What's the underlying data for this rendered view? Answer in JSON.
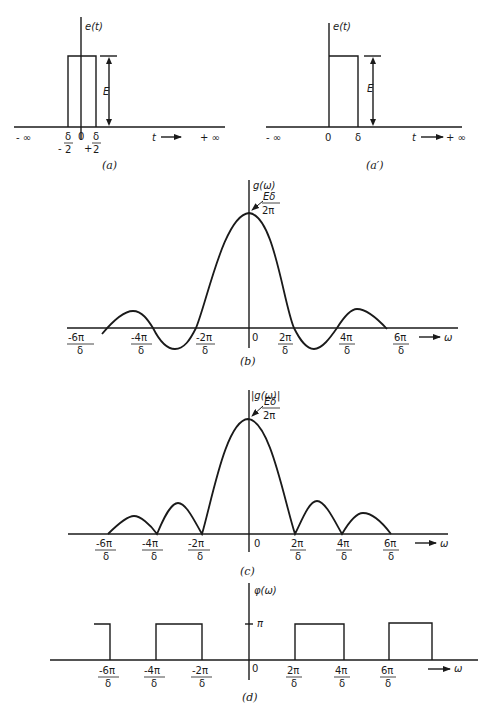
{
  "panel_a": {
    "ylabel": "e(t)",
    "height_label": "E",
    "xlabel": "t",
    "left_inf": "- ∞",
    "right_inf": "+ ∞",
    "origin": "0",
    "left_edge_num": "δ",
    "left_edge_den": "2",
    "left_edge_sign": "-",
    "right_edge_num": "δ",
    "right_edge_den": "2",
    "right_edge_sign": "+",
    "caption": "(a)"
  },
  "panel_a_prime": {
    "ylabel": "e(t)",
    "height_label": "E",
    "xlabel": "t",
    "left_inf": "- ∞",
    "right_inf": "+ ∞",
    "origin": "0",
    "edge": "δ",
    "caption": "(a′)"
  },
  "panel_b": {
    "ylabel": "g(ω)",
    "peak_num": "Eδ",
    "peak_den": "2π",
    "xlabel": "ω",
    "origin": "0",
    "ticks": [
      {
        "num": "-6π",
        "den": "δ"
      },
      {
        "num": "-4π",
        "den": "δ"
      },
      {
        "num": "-2π",
        "den": "δ"
      },
      {
        "num": "2π",
        "den": "δ"
      },
      {
        "num": "4π",
        "den": "δ"
      },
      {
        "num": "6π",
        "den": "δ"
      }
    ],
    "caption": "(b)"
  },
  "panel_c": {
    "ylabel": "|g(ω)|",
    "peak_num": "Eδ",
    "peak_den": "2π",
    "xlabel": "ω",
    "origin": "0",
    "ticks": [
      {
        "num": "-6π",
        "den": "δ"
      },
      {
        "num": "-4π",
        "den": "δ"
      },
      {
        "num": "-2π",
        "den": "δ"
      },
      {
        "num": "2π",
        "den": "δ"
      },
      {
        "num": "4π",
        "den": "δ"
      },
      {
        "num": "6π",
        "den": "δ"
      }
    ],
    "caption": "(c)"
  },
  "panel_d": {
    "ylabel": "φ(ω)",
    "level_label": "π",
    "xlabel": "ω",
    "origin": "0",
    "ticks": [
      {
        "num": "-6π",
        "den": "δ"
      },
      {
        "num": "-4π",
        "den": "δ"
      },
      {
        "num": "-2π",
        "den": "δ"
      },
      {
        "num": "2π",
        "den": "δ"
      },
      {
        "num": "4π",
        "den": "δ"
      },
      {
        "num": "6π",
        "den": "δ"
      }
    ],
    "caption": "(d)"
  }
}
